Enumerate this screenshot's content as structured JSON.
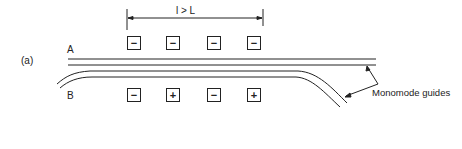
{
  "figure": {
    "panel_label": "(a)",
    "dimension_label": "l > L",
    "guide_a_label": "A",
    "guide_b_label": "B",
    "annotation": "Monomode guides"
  },
  "electrodes": {
    "row_a": [
      {
        "sign": "−"
      },
      {
        "sign": "−"
      },
      {
        "sign": "−"
      },
      {
        "sign": "−"
      }
    ],
    "row_b": [
      {
        "sign": "−"
      },
      {
        "sign": "+"
      },
      {
        "sign": "−"
      },
      {
        "sign": "+"
      }
    ]
  }
}
